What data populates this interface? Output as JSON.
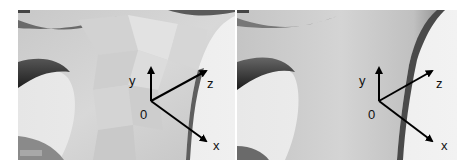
{
  "figure": {
    "panels": [
      {
        "id": "left",
        "description": "Faceted (low-poly) 3D surface rendering",
        "axes": {
          "origin_label": "0",
          "x_label": "x",
          "y_label": "y",
          "z_label": "z"
        }
      },
      {
        "id": "right",
        "description": "Smooth-shaded 3D surface rendering",
        "axes": {
          "origin_label": "0",
          "x_label": "x",
          "y_label": "y",
          "z_label": "z"
        }
      }
    ],
    "colors": {
      "background": "#ffffff",
      "surface_light": "#d9d9d9",
      "surface_mid": "#b8b8b8",
      "surface_dark": "#3a3a3a",
      "axis": "#000000"
    }
  }
}
